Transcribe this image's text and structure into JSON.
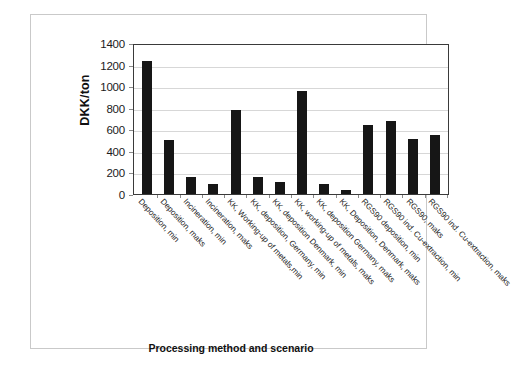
{
  "chart_data": {
    "type": "bar",
    "title": "",
    "xlabel": "Processing method and scenario",
    "ylabel": "DKK/ton",
    "ylim": [
      0,
      1400
    ],
    "ytick_step": 200,
    "yticks": [
      "1400",
      "1200",
      "1000",
      "800",
      "600",
      "400",
      "200",
      "0"
    ],
    "grid": true,
    "legend": "none",
    "bar_color": "#161616",
    "categories": [
      "Deposition, min",
      "Deposition, maks",
      "Incineration, min",
      "Incineration, maks",
      "KK, Working-up of metals,min",
      "KK, deposition, Germany, min",
      "KK, deposition Denmark, min",
      "KK, working-up of metals, maks",
      "KK, deposition Germany, maks",
      "KK, Deposition, Denmark, maks",
      "RGS90 deposition, min",
      "RGS90 ind. Cu-extraction, min",
      "RGS90, maks",
      "RGS90 ind. Cu-extraction, maks"
    ],
    "values": [
      1235,
      505,
      160,
      90,
      775,
      160,
      110,
      960,
      95,
      35,
      640,
      675,
      510,
      545
    ]
  }
}
